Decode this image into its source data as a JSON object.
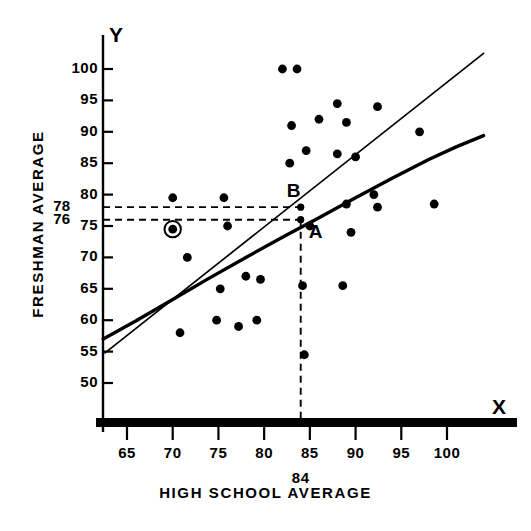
{
  "chart_data": {
    "type": "scatter",
    "title": "",
    "xlabel": "HIGH SCHOOL AVERAGE",
    "ylabel": "FRESHMAN AVERAGE",
    "x_axis_letter": "X",
    "y_axis_letter": "Y",
    "xlim": [
      62,
      104
    ],
    "ylim": [
      46,
      103
    ],
    "grid": false,
    "legend": "none",
    "xticks": [
      65,
      70,
      75,
      80,
      85,
      90,
      95,
      100
    ],
    "xtick_labels": [
      "65",
      "70",
      "75",
      "80",
      "85",
      "90",
      "95",
      "100"
    ],
    "yticks": [
      50,
      55,
      60,
      65,
      70,
      75,
      80,
      85,
      90,
      95,
      100
    ],
    "ytick_labels": [
      "50",
      "55",
      "60",
      "65",
      "70",
      "75",
      "80",
      "85",
      "90",
      "95",
      "100"
    ],
    "special_ytick_labels": [
      "78",
      "76"
    ],
    "special_yticks": [
      78,
      76
    ],
    "special_xtick_labels": [
      "84"
    ],
    "special_xticks": [
      84
    ],
    "points": [
      {
        "x": 82.0,
        "y": 100.0
      },
      {
        "x": 83.6,
        "y": 100.0
      },
      {
        "x": 88.0,
        "y": 94.5
      },
      {
        "x": 92.4,
        "y": 94.0
      },
      {
        "x": 83.0,
        "y": 91.0
      },
      {
        "x": 86.0,
        "y": 92.0
      },
      {
        "x": 89.0,
        "y": 91.5
      },
      {
        "x": 97.0,
        "y": 90.0
      },
      {
        "x": 84.6,
        "y": 87.0
      },
      {
        "x": 88.0,
        "y": 86.5
      },
      {
        "x": 90.0,
        "y": 86.0
      },
      {
        "x": 82.8,
        "y": 85.0
      },
      {
        "x": 70.0,
        "y": 79.5
      },
      {
        "x": 75.6,
        "y": 79.5
      },
      {
        "x": 92.0,
        "y": 80.0
      },
      {
        "x": 89.0,
        "y": 78.5
      },
      {
        "x": 92.4,
        "y": 78.0
      },
      {
        "x": 98.6,
        "y": 78.5
      },
      {
        "x": 70.0,
        "y": 74.5,
        "marker": "circled"
      },
      {
        "x": 76.0,
        "y": 75.0
      },
      {
        "x": 85.0,
        "y": 75.0
      },
      {
        "x": 89.5,
        "y": 74.0
      },
      {
        "x": 71.6,
        "y": 70.0
      },
      {
        "x": 78.0,
        "y": 67.0
      },
      {
        "x": 79.6,
        "y": 66.5
      },
      {
        "x": 84.2,
        "y": 65.5
      },
      {
        "x": 88.6,
        "y": 65.5
      },
      {
        "x": 75.2,
        "y": 65.0
      },
      {
        "x": 70.8,
        "y": 58.0
      },
      {
        "x": 74.8,
        "y": 60.0
      },
      {
        "x": 79.2,
        "y": 60.0
      },
      {
        "x": 77.2,
        "y": 59.0
      },
      {
        "x": 84.4,
        "y": 54.5
      }
    ],
    "curves": [
      {
        "name": "linear-regression-line",
        "style": "thin",
        "points": [
          [
            62.6,
            54.8
          ],
          [
            104.0,
            102.5
          ]
        ]
      },
      {
        "name": "nonlinear-regression-curve",
        "style": "thick",
        "points": [
          [
            62.4,
            57.0
          ],
          [
            66,
            59.9
          ],
          [
            70,
            63.3
          ],
          [
            74,
            66.7
          ],
          [
            78,
            70.0
          ],
          [
            82,
            73.2
          ],
          [
            86,
            76.3
          ],
          [
            90,
            79.5
          ],
          [
            94,
            82.6
          ],
          [
            98,
            85.6
          ],
          [
            101,
            87.6
          ],
          [
            104,
            89.4
          ]
        ]
      }
    ],
    "reference_lines": [
      {
        "name": "x-84-dashed",
        "orientation": "vertical",
        "value": 84
      },
      {
        "name": "y-78-dashed",
        "orientation": "horizontal",
        "value": 78
      },
      {
        "name": "y-76-dashed",
        "orientation": "horizontal",
        "value": 76
      }
    ],
    "annotated_points": [
      {
        "label": "B",
        "x": 84,
        "y": 78
      },
      {
        "label": "A",
        "x": 84,
        "y": 76
      }
    ]
  }
}
